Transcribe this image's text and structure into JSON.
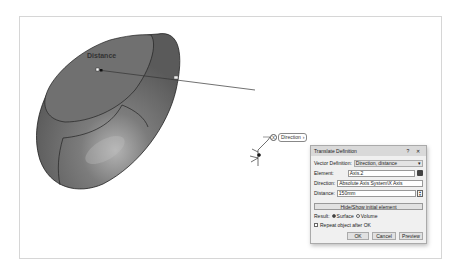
{
  "viewport": {
    "shape_label": "Distance",
    "direction_tag": {
      "label": "Direction",
      "icon": "x-axis-badge"
    },
    "compass": "axis-triad-icon"
  },
  "dialog": {
    "title": "Translate Definition",
    "help_label": "?",
    "close_label": "✕",
    "vector_definition": {
      "label": "Vector Definition:",
      "value": "Direction, distance"
    },
    "element": {
      "label": "Element:",
      "value": "Axis.2"
    },
    "direction": {
      "label": "Direction:",
      "value": "Absolute Axis System\\X Axis"
    },
    "distance": {
      "label": "Distance:",
      "value": "150mm"
    },
    "hide_show_label": "Hide/Show initial element",
    "result": {
      "label": "Result:",
      "options": [
        "Surface",
        "Volume"
      ],
      "selected": "Surface"
    },
    "repeat_label": "Repeat object after OK",
    "repeat_checked": false,
    "buttons": {
      "ok": "OK",
      "cancel": "Cancel",
      "preview": "Preview"
    }
  },
  "colors": {
    "surface": "#6e6e6e",
    "surface_highlight": "#bdbdbd",
    "dialog_bg": "#f0f0f0",
    "title_bar": "#d9d9d9"
  }
}
